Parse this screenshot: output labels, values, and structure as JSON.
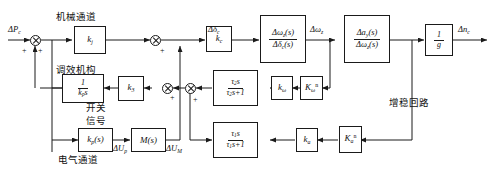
{
  "diagram": {
    "type": "control-block-diagram",
    "width": 498,
    "height": 169,
    "line_color": "#1a1a1a",
    "background": "#ffffff"
  },
  "annotations": {
    "mechanical_channel": "机械通道",
    "trim_mechanism": "调效机构",
    "switch": "开关",
    "switch_signal": "信号",
    "electrical_channel": "电气通道",
    "stability_loop": "增稳回路"
  },
  "signals": {
    "input": "ΔP",
    "input_sub": "c",
    "delta_delta": "Δδ",
    "delta_delta_sub": "c",
    "delta_omega": "Δω",
    "delta_omega_sub": "z",
    "delta_u_p": "ΔU",
    "delta_u_p_sub": "p",
    "delta_u_m": "ΔU",
    "delta_u_m_sub": "M",
    "output": "Δn",
    "output_sub": "c"
  },
  "blocks": {
    "k_j": {
      "label": "k",
      "sub": "j",
      "name": "gain-kj"
    },
    "k_p_s": {
      "num": "1",
      "den_label": "k",
      "den_sub": "p",
      "den_tail": "s",
      "name": "integrator-1-over-kps"
    },
    "k_p_tf": {
      "label": "k",
      "sub": "p",
      "tail": "(s)",
      "name": "transfer-kp-s"
    },
    "m_s": {
      "label": "M",
      "tail": "(s)",
      "name": "transfer-M-s"
    },
    "k_3": {
      "label": "k",
      "sub": "3",
      "name": "gain-k3"
    },
    "k_c": {
      "label": "k",
      "sub": "c",
      "name": "gain-kc"
    },
    "omega_over_delta": {
      "num": "Δω",
      "num_sub": "z",
      "num_tail": "(s)",
      "den": "Δδ",
      "den_sub": "c",
      "den_tail": "(s)",
      "name": "tf-omega-over-delta"
    },
    "a_over_omega": {
      "num": "Δa",
      "num_sub": "y",
      "num_tail": "(s)",
      "den": "Δω",
      "den_sub": "z",
      "den_tail": "(s)",
      "name": "tf-a-over-omega"
    },
    "one_over_g": {
      "num": "1",
      "den": "g",
      "name": "gain-1-over-g"
    },
    "washout_2": {
      "num": "τ",
      "num_sub": "2",
      "num_tail": "s",
      "den": "τ",
      "den_sub": "2",
      "den_tail": "s+1",
      "name": "washout-tau2"
    },
    "washout_1": {
      "num": "τ",
      "num_sub": "1",
      "num_tail": "s",
      "den": "τ",
      "den_sub": "1",
      "den_tail": "s+1",
      "name": "washout-tau1"
    },
    "k_omega": {
      "label": "k",
      "sub": "ω",
      "name": "gain-k-omega"
    },
    "K_omega_n": {
      "label": "K",
      "sub": "ω",
      "sup": "n",
      "name": "gain-K-omega-n"
    },
    "k_a": {
      "label": "k",
      "sub": "a",
      "name": "gain-ka"
    },
    "K_a_n": {
      "label": "K",
      "sub": "a",
      "sup": "n",
      "name": "gain-K-a-n"
    }
  },
  "summing_junctions": [
    {
      "name": "sum-input",
      "signs": [
        "+",
        "+"
      ]
    },
    {
      "name": "sum-channel-merge",
      "signs": [
        "+"
      ]
    },
    {
      "name": "sum-feedback-inner",
      "signs": [
        "+"
      ]
    },
    {
      "name": "sum-feedback-outer",
      "signs": [
        "+"
      ]
    }
  ]
}
